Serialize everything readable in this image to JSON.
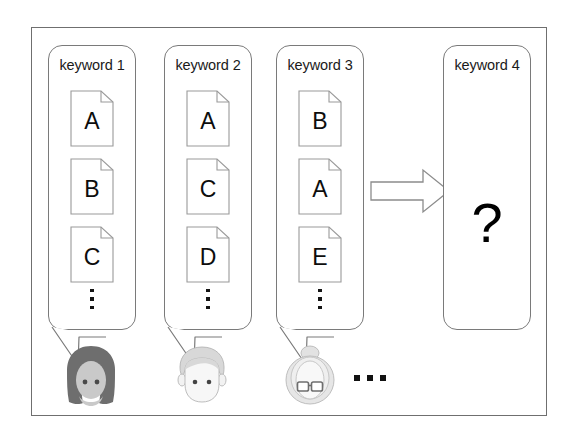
{
  "diagram": {
    "frame_color": "#6f6f6f",
    "bubble_border_color": "#7a7a7a"
  },
  "columns": [
    {
      "label": "keyword 1",
      "documents": [
        "A",
        "B",
        "C"
      ],
      "continues": "⋮",
      "speaker": "woman-avatar",
      "speaker_color": "#6e6e6e"
    },
    {
      "label": "keyword 2",
      "documents": [
        "A",
        "C",
        "D"
      ],
      "continues": "⋮",
      "speaker": "man-avatar",
      "speaker_color": "#d8d8d8"
    },
    {
      "label": "keyword 3",
      "documents": [
        "B",
        "A",
        "E"
      ],
      "continues": "⋮",
      "speaker": "elderly-avatar",
      "speaker_color": "#dcdcdc"
    }
  ],
  "more_speakers": "…",
  "arrow": {
    "name": "right-block-arrow",
    "direction": "right",
    "color": "#8c8c8c"
  },
  "result": {
    "label": "keyword 4",
    "content": "?"
  }
}
